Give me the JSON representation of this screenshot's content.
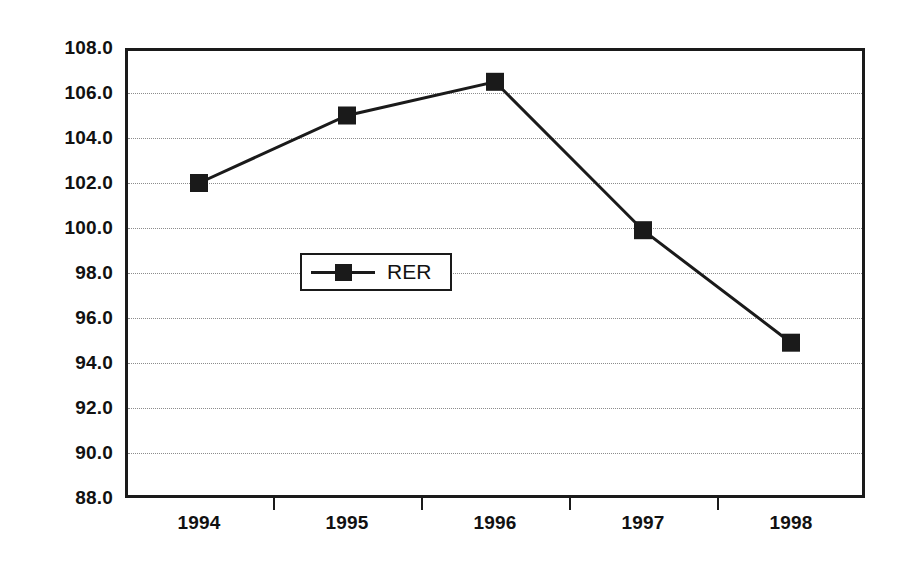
{
  "chart_data": {
    "type": "line",
    "title": "",
    "xlabel": "",
    "ylabel": "",
    "categories": [
      "1994",
      "1995",
      "1996",
      "1997",
      "1998"
    ],
    "series": [
      {
        "name": "RER",
        "values": [
          102.0,
          105.0,
          106.5,
          99.9,
          94.9
        ],
        "marker": "square",
        "color": "#1a1a1a"
      }
    ],
    "ylim": [
      88.0,
      108.0
    ],
    "ytick_step": 2.0,
    "ytick_labels": [
      "108.0",
      "106.0",
      "104.0",
      "102.0",
      "100.0",
      "98.0",
      "96.0",
      "94.0",
      "92.0",
      "90.0",
      "88.0"
    ],
    "ytick_values": [
      108.0,
      106.0,
      104.0,
      102.0,
      100.0,
      98.0,
      96.0,
      94.0,
      92.0,
      90.0,
      88.0
    ],
    "grid": true,
    "grid_style": "dotted",
    "grid_color": "#8c8c8c",
    "legend_position": "inside-center-left",
    "legend_entries": [
      "RER"
    ],
    "axis_color": "#1a1a1a",
    "background": "#ffffff"
  },
  "legend": {
    "label": "RER"
  }
}
